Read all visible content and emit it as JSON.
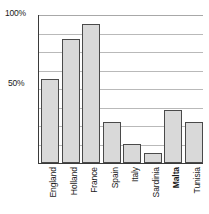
{
  "chart_data": {
    "type": "bar",
    "title": "",
    "subtitle": "",
    "xlabel": "",
    "ylabel": "",
    "categories": [
      "England",
      "Holland",
      "France",
      "Spain",
      "Italy",
      "Sardinia",
      "Malta",
      "Tunisia"
    ],
    "values": [
      57,
      84,
      94,
      28,
      13,
      7,
      36,
      28
    ],
    "ylim": [
      0,
      100
    ],
    "yticks": [
      0,
      12.5,
      25,
      37.5,
      50,
      62.5,
      75,
      87.5,
      100
    ],
    "ytick_labels_visible": [
      "100%",
      "50%"
    ],
    "grid": true,
    "grid_orientation": "horizontal",
    "legend": "none",
    "bar_fill_color": "#d9d9d9",
    "bar_border_color": "#4a4a4a",
    "grid_color": "#b9b9b9",
    "axis_color": "#3a3a3a",
    "bold_categories": [
      "Malta"
    ]
  },
  "axis": {
    "y_label_top": "100%",
    "y_label_mid": "50%"
  },
  "categories_display": [
    {
      "label": "England",
      "bold": false
    },
    {
      "label": "Holland",
      "bold": false
    },
    {
      "label": "France",
      "bold": false
    },
    {
      "label": "Spain",
      "bold": false
    },
    {
      "label": "Italy",
      "bold": false
    },
    {
      "label": "Sardinia",
      "bold": false
    },
    {
      "label": "Malta",
      "bold": true
    },
    {
      "label": "Tunisia",
      "bold": false
    }
  ]
}
